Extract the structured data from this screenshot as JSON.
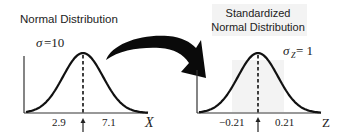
{
  "left_panel": {
    "title": "Normal Distribution",
    "sigma_symbol": "σ",
    "sigma_text": " =10",
    "tick_left": "2.9",
    "tick_right": "7.1",
    "axis_label": "X"
  },
  "right_panel": {
    "title_line1": "Standardized",
    "title_line2": "Normal Distribution",
    "sigma_symbol": "σ",
    "sigma_subscript": "Z",
    "sigma_text": " = 1",
    "tick_left": "−0.21",
    "tick_right": "0.21",
    "axis_label": "Z"
  },
  "transform_arrow": {
    "meaning": "transformation from X to Z"
  },
  "colors": {
    "ink": "#111111",
    "background": "#ffffff",
    "shade": "#f3f3f3"
  }
}
